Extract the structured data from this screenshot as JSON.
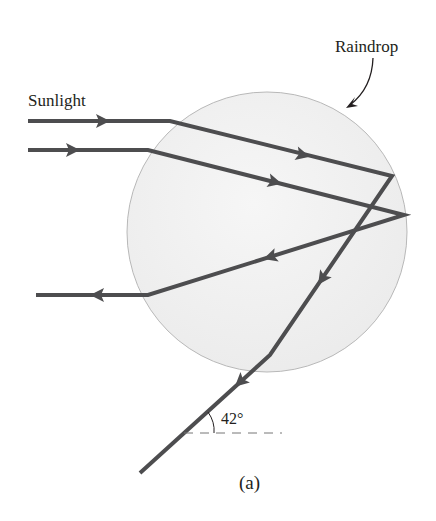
{
  "figure": {
    "labels": {
      "sunlight": "Sunlight",
      "raindrop": "Raindrop",
      "angle": "42°",
      "caption": "(a)"
    },
    "colors": {
      "ray": "#4d4d4f",
      "drop_fill": "#efefef",
      "drop_stroke": "#b8b8b8",
      "text": "#231f20",
      "dashed": "#777777"
    },
    "raindrop": {
      "cx": 267,
      "cy": 232,
      "r": 140
    },
    "rays": [
      {
        "name": "ray-upper",
        "path": [
          [
            28,
            121
          ],
          [
            170,
            121
          ],
          [
            392,
            176
          ],
          [
            270,
            355
          ],
          [
            140,
            473
          ]
        ],
        "note": "enters top, reflects off back, exits bottom at 42°"
      },
      {
        "name": "ray-lower",
        "path": [
          [
            28,
            150
          ],
          [
            148,
            150
          ],
          [
            404,
            215
          ],
          [
            148,
            295
          ],
          [
            36,
            295
          ]
        ],
        "note": "enters, reflects off back, exits left"
      }
    ]
  }
}
